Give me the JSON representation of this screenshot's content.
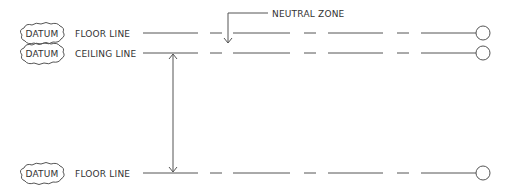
{
  "diagram": {
    "datum_tag": "DATUM",
    "rows": [
      {
        "label": "FLOOR LINE",
        "y": 33
      },
      {
        "label": "CEILING LINE",
        "y": 53
      },
      {
        "label": "FLOOR LINE",
        "y": 173
      }
    ],
    "annotation": {
      "label": "NEUTRAL ZONE"
    },
    "colors": {
      "line": "#555555",
      "text": "#333333",
      "background": "#ffffff"
    }
  }
}
